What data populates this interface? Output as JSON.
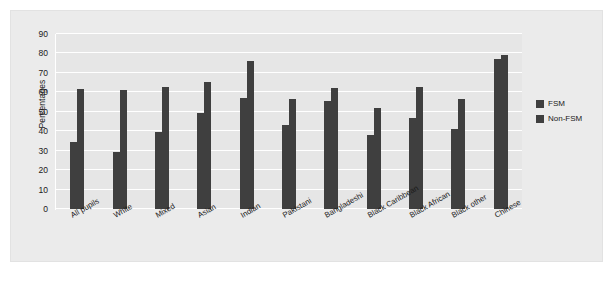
{
  "chart_data": {
    "type": "bar",
    "title": "",
    "xlabel": "",
    "ylabel": "Percentages",
    "ylim": [
      0,
      90
    ],
    "yticks": [
      0,
      10,
      20,
      30,
      40,
      50,
      60,
      70,
      80,
      90
    ],
    "grid": true,
    "legend_position": "right",
    "categories": [
      "All pupils",
      "White",
      "Mixed",
      "Asian",
      "Indian",
      "Pakistani",
      "Bangladeshi",
      "Black Caribbean",
      "Black African",
      "Black other",
      "Chinese"
    ],
    "series": [
      {
        "name": "FSM",
        "color": "#3f3f3f",
        "values": [
          34.5,
          29.5,
          39.5,
          49.5,
          57,
          43,
          55.5,
          38,
          47,
          41,
          77
        ]
      },
      {
        "name": "Non-FSM",
        "color": "#3f3f3f",
        "values": [
          61.5,
          61,
          63,
          65.5,
          76,
          56.5,
          62,
          52,
          63,
          56.5,
          79
        ]
      }
    ]
  },
  "legend": {
    "items": [
      {
        "label": "FSM"
      },
      {
        "label": "Non-FSM"
      }
    ]
  },
  "colors": {
    "bar": "#3f3f3f",
    "plot_background": "#e6e6e6",
    "canvas_background": "#ebebeb",
    "gridline": "#ffffff",
    "text": "#1a1a1a"
  }
}
